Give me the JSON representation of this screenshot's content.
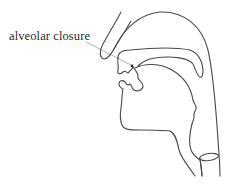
{
  "diagram": {
    "type": "sagittal section of vocal tract",
    "annotation": {
      "label": "alveolar closure",
      "target": "tongue tip contacting alveolar ridge"
    },
    "colors": {
      "line": "#4a4a4a",
      "leader": "#9a9a9a",
      "text": "#2a2a2a",
      "background": "#ffffff"
    }
  }
}
